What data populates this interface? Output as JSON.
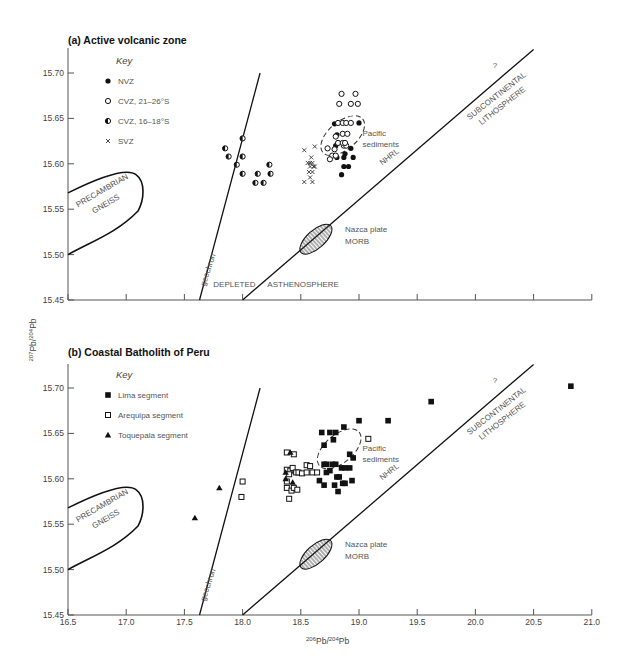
{
  "figure": {
    "y_axis_label": "207Pb/204Pb",
    "x_axis_label": "206Pb/204Pb",
    "panels": [
      {
        "id": "a",
        "title": "(a) Active volcanic zone"
      },
      {
        "id": "b",
        "title": "(b) Coastal Batholith of Peru"
      }
    ],
    "key_title": "Key",
    "region_labels": {
      "precambrian": [
        "PRECAMBRIAN",
        "GNEISS"
      ],
      "geochron": "geochron",
      "depleted": "DEPLETED",
      "asthenosphere": "ASTHENOSPHERE",
      "nazca": [
        "Nazca plate",
        "MORB"
      ],
      "pacific": [
        "Pacific",
        "sediments"
      ],
      "nhrl": "NHRL",
      "subcont_q": "?",
      "subcont": [
        "SUBCONTINENTAL",
        "LITHOSPHERE"
      ]
    }
  },
  "chart_data": [
    {
      "type": "scatter",
      "title": "(a) Active volcanic zone",
      "xlabel": "206Pb/204Pb",
      "ylabel": "207Pb/204Pb",
      "xlim": [
        16.5,
        21.0
      ],
      "ylim": [
        15.45,
        15.72
      ],
      "yticks": [
        "15.45",
        "15.50",
        "15.55",
        "15.60",
        "15.65",
        "15.70"
      ],
      "legend": [
        "NVZ",
        "CVZ, 21–26°S",
        "CVZ, 16–18°S",
        "SVZ"
      ],
      "series": [
        {
          "name": "NVZ",
          "marker": "filled-circle",
          "points": [
            [
              18.79,
              15.644
            ],
            [
              19.0,
              15.645
            ],
            [
              18.88,
              15.611
            ],
            [
              18.8,
              15.62
            ],
            [
              18.93,
              15.617
            ],
            [
              18.81,
              15.607
            ],
            [
              18.87,
              15.607
            ],
            [
              18.95,
              15.607
            ],
            [
              18.87,
              15.597
            ],
            [
              18.91,
              15.597
            ],
            [
              18.85,
              15.588
            ],
            [
              18.81,
              15.632
            ]
          ]
        },
        {
          "name": "CVZ, 21–26°S",
          "marker": "open-circle",
          "points": [
            [
              18.85,
              15.677
            ],
            [
              18.97,
              15.677
            ],
            [
              18.83,
              15.666
            ],
            [
              18.93,
              15.666
            ],
            [
              18.99,
              15.666
            ],
            [
              18.82,
              15.645
            ],
            [
              18.86,
              15.645
            ],
            [
              18.89,
              15.645
            ],
            [
              18.93,
              15.645
            ],
            [
              18.8,
              15.63
            ],
            [
              18.86,
              15.633
            ],
            [
              18.9,
              15.633
            ],
            [
              18.87,
              15.62
            ],
            [
              18.89,
              15.62
            ],
            [
              18.82,
              15.623
            ],
            [
              18.86,
              15.623
            ],
            [
              18.88,
              15.623
            ],
            [
              18.73,
              15.617
            ],
            [
              18.79,
              15.616
            ],
            [
              18.77,
              15.609
            ],
            [
              18.8,
              15.609
            ],
            [
              18.75,
              15.605
            ]
          ]
        },
        {
          "name": "CVZ, 16–18°S",
          "marker": "half-circle",
          "points": [
            [
              18.0,
              15.628
            ],
            [
              17.85,
              15.617
            ],
            [
              17.88,
              15.608
            ],
            [
              18.0,
              15.608
            ],
            [
              17.95,
              15.599
            ],
            [
              18.0,
              15.589
            ],
            [
              18.23,
              15.599
            ],
            [
              18.24,
              15.589
            ],
            [
              18.13,
              15.589
            ],
            [
              18.11,
              15.579
            ],
            [
              18.18,
              15.579
            ]
          ]
        },
        {
          "name": "SVZ",
          "marker": "cross",
          "points": [
            [
              18.53,
              15.615
            ],
            [
              18.62,
              15.619
            ],
            [
              18.59,
              15.607
            ],
            [
              18.56,
              15.601
            ],
            [
              18.58,
              15.601
            ],
            [
              18.6,
              15.601
            ],
            [
              18.58,
              15.597
            ],
            [
              18.61,
              15.597
            ],
            [
              18.62,
              15.597
            ],
            [
              18.57,
              15.591
            ],
            [
              18.6,
              15.591
            ],
            [
              18.53,
              15.58
            ],
            [
              18.58,
              15.585
            ],
            [
              18.6,
              15.58
            ]
          ]
        }
      ],
      "lines": {
        "geochron": [
          [
            17.63,
            15.45
          ],
          [
            18.15,
            15.7
          ]
        ],
        "nhrl": [
          [
            18.0,
            15.45
          ],
          [
            20.5,
            15.72
          ]
        ]
      },
      "regions": [
        "Precambrian gneiss",
        "Nazca plate MORB",
        "Pacific sediments",
        "Depleted asthenosphere",
        "? Subcontinental lithosphere"
      ]
    },
    {
      "type": "scatter",
      "title": "(b) Coastal Batholith of Peru",
      "xlabel": "206Pb/204Pb",
      "ylabel": "207Pb/204Pb",
      "xlim": [
        16.5,
        21.0
      ],
      "ylim": [
        15.45,
        15.72
      ],
      "xticks": [
        "16.5",
        "17.0",
        "17.5",
        "18.0",
        "18.5",
        "19.0",
        "19.5",
        "20.0",
        "20.5",
        "21.0"
      ],
      "yticks": [
        "15.45",
        "15.50",
        "15.55",
        "15.60",
        "15.65",
        "15.70"
      ],
      "legend": [
        "Lima segment",
        "Arequipa segment",
        "Toquepala segment"
      ],
      "series": [
        {
          "name": "Lima segment",
          "marker": "filled-square",
          "points": [
            [
              20.82,
              15.702
            ],
            [
              19.62,
              15.685
            ],
            [
              19.25,
              15.664
            ],
            [
              19.0,
              15.664
            ],
            [
              18.87,
              15.657
            ],
            [
              18.8,
              15.651
            ],
            [
              18.68,
              15.651
            ],
            [
              18.75,
              15.651
            ],
            [
              18.78,
              15.643
            ],
            [
              18.7,
              15.637
            ],
            [
              18.92,
              15.627
            ],
            [
              18.95,
              15.623
            ],
            [
              18.7,
              15.616
            ],
            [
              18.72,
              15.616
            ],
            [
              18.77,
              15.616
            ],
            [
              18.8,
              15.616
            ],
            [
              18.85,
              15.612
            ],
            [
              18.88,
              15.612
            ],
            [
              18.92,
              15.612
            ],
            [
              18.72,
              15.607
            ],
            [
              18.75,
              15.609
            ],
            [
              18.81,
              15.602
            ],
            [
              18.83,
              15.602
            ],
            [
              18.94,
              15.598
            ],
            [
              18.66,
              15.598
            ],
            [
              18.7,
              15.593
            ],
            [
              18.79,
              15.593
            ],
            [
              18.86,
              15.595
            ],
            [
              18.88,
              15.595
            ],
            [
              18.82,
              15.586
            ]
          ]
        },
        {
          "name": "Arequipa segment",
          "marker": "open-square",
          "points": [
            [
              19.08,
              15.644
            ],
            [
              18.38,
              15.629
            ],
            [
              18.44,
              15.627
            ],
            [
              18.38,
              15.61
            ],
            [
              18.41,
              15.609
            ],
            [
              18.43,
              15.612
            ],
            [
              18.46,
              15.607
            ],
            [
              18.48,
              15.607
            ],
            [
              18.51,
              15.606
            ],
            [
              18.55,
              15.615
            ],
            [
              18.55,
              15.607
            ],
            [
              18.6,
              15.607
            ],
            [
              18.38,
              15.597
            ],
            [
              18.4,
              15.605
            ],
            [
              18.38,
              15.59
            ],
            [
              18.42,
              15.587
            ],
            [
              18.44,
              15.59
            ],
            [
              18.47,
              15.588
            ],
            [
              18.4,
              15.578
            ],
            [
              18.0,
              15.597
            ],
            [
              17.99,
              15.58
            ],
            [
              18.58,
              15.614
            ],
            [
              18.64,
              15.607
            ]
          ]
        },
        {
          "name": "Toquepala segment",
          "marker": "filled-triangle",
          "points": [
            [
              18.41,
              15.629
            ],
            [
              18.37,
              15.607
            ],
            [
              18.43,
              15.596
            ],
            [
              18.37,
              15.6
            ],
            [
              17.8,
              15.59
            ],
            [
              17.59,
              15.557
            ]
          ]
        }
      ],
      "lines": {
        "geochron": [
          [
            17.63,
            15.45
          ],
          [
            18.15,
            15.7
          ]
        ],
        "nhrl": [
          [
            18.0,
            15.45
          ],
          [
            20.5,
            15.72
          ]
        ]
      },
      "regions": [
        "Precambrian gneiss",
        "Nazca plate MORB",
        "Pacific sediments",
        "? Subcontinental lithosphere"
      ]
    }
  ]
}
